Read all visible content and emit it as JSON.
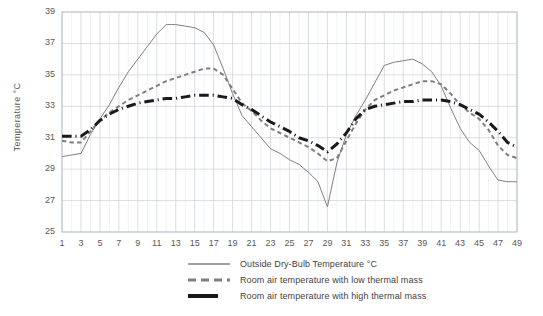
{
  "chart_data": {
    "type": "line",
    "title": "",
    "xlabel": "",
    "ylabel": "Temperature °C",
    "xlim": [
      1,
      49
    ],
    "ylim": [
      25,
      39
    ],
    "ytick_step": 2,
    "xtick_step": 2,
    "grid": true,
    "minor_grid": true,
    "legend_position": "bottom",
    "yticks": [
      25,
      27,
      29,
      31,
      33,
      35,
      37,
      39
    ],
    "xticks": [
      1,
      3,
      5,
      7,
      9,
      11,
      13,
      15,
      17,
      19,
      21,
      23,
      25,
      27,
      29,
      31,
      33,
      35,
      37,
      39,
      41,
      43,
      45,
      47,
      49
    ],
    "x": [
      1,
      2,
      3,
      4,
      5,
      6,
      7,
      8,
      9,
      10,
      11,
      12,
      13,
      14,
      15,
      16,
      17,
      18,
      19,
      20,
      21,
      22,
      23,
      24,
      25,
      26,
      27,
      28,
      29,
      30,
      31,
      32,
      33,
      34,
      35,
      36,
      37,
      38,
      39,
      40,
      41,
      42,
      43,
      44,
      45,
      46,
      47,
      48,
      49
    ],
    "series": [
      {
        "name": "Outside Dry-Bulb Temperature °C",
        "style": "solid",
        "color": "#808080",
        "width": 1,
        "values": [
          29.8,
          29.9,
          30.0,
          31.2,
          32.2,
          33.1,
          34.2,
          35.2,
          36.0,
          36.8,
          37.6,
          38.2,
          38.2,
          38.1,
          38.0,
          37.7,
          36.9,
          35.4,
          33.8,
          32.4,
          31.7,
          31.0,
          30.3,
          30.0,
          29.6,
          29.3,
          28.8,
          28.2,
          26.6,
          29.4,
          31.2,
          32.4,
          33.4,
          34.5,
          35.6,
          35.8,
          35.9,
          36.0,
          35.7,
          35.2,
          34.3,
          32.9,
          31.6,
          30.7,
          30.2,
          29.2,
          28.3,
          28.2,
          28.2
        ]
      },
      {
        "name": "Room air temperature with low thermal mass",
        "style": "dashed",
        "color": "#7f7f7f",
        "width": 2,
        "values": [
          30.8,
          30.7,
          30.7,
          31.4,
          32.1,
          32.6,
          33.0,
          33.4,
          33.7,
          34.0,
          34.3,
          34.6,
          34.8,
          35.0,
          35.2,
          35.4,
          35.4,
          35.0,
          34.1,
          33.2,
          32.7,
          32.1,
          31.6,
          31.3,
          31.0,
          30.7,
          30.4,
          30.0,
          29.5,
          29.7,
          30.8,
          31.9,
          32.8,
          33.4,
          33.7,
          34.0,
          34.2,
          34.4,
          34.6,
          34.6,
          34.4,
          33.8,
          33.1,
          32.6,
          32.2,
          31.5,
          30.5,
          29.9,
          29.7
        ]
      },
      {
        "name": "Room air temperature with high thermal mass",
        "style": "dashdot",
        "color": "#1a1a1a",
        "width": 3,
        "values": [
          31.1,
          31.1,
          31.1,
          31.5,
          32.1,
          32.5,
          32.8,
          33.0,
          33.2,
          33.3,
          33.4,
          33.5,
          33.5,
          33.6,
          33.7,
          33.7,
          33.7,
          33.6,
          33.5,
          33.1,
          32.8,
          32.4,
          32.0,
          31.7,
          31.4,
          31.0,
          30.8,
          30.5,
          30.1,
          30.6,
          31.3,
          32.2,
          32.8,
          33.0,
          33.1,
          33.2,
          33.3,
          33.3,
          33.4,
          33.4,
          33.4,
          33.3,
          33.1,
          32.8,
          32.5,
          32.0,
          31.4,
          30.7,
          30.4
        ]
      }
    ]
  },
  "axis": {
    "y_title": "Temperature °C"
  },
  "legend": {
    "entries": [
      {
        "label": "Outside Dry-Bulb Temperature °C"
      },
      {
        "label": "Room air temperature with low thermal mass"
      },
      {
        "label": "Room air temperature with high thermal mass"
      }
    ]
  },
  "colors": {
    "outside_line": "#808080",
    "low_mass_line": "#7f7f7f",
    "high_mass_line": "#1a1a1a",
    "grid_major": "#c9cfd6",
    "grid_minor": "#e6eaee",
    "axis_text": "#595959",
    "plot_border": "#b7bfc7"
  }
}
